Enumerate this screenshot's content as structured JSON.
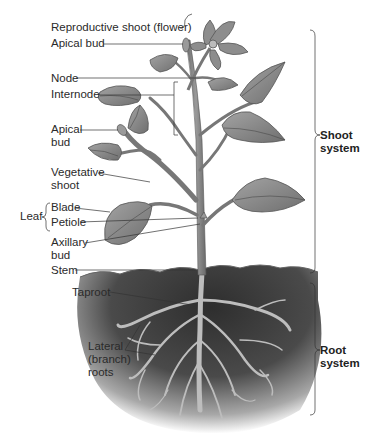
{
  "diagram": {
    "style": "grayscale",
    "colors": {
      "background": "#ffffff",
      "leaf_fill": "#8a8a8a",
      "leaf_vein": "#555555",
      "stem": "#7a7a7a",
      "soil_dark": "#3a3a3a",
      "root": "#b5b5b5",
      "label_text": "#2a2a2a",
      "leader_line": "#333333"
    }
  },
  "labels": {
    "reproductive_shoot": "Reproductive shoot (flower)",
    "apical_bud_top": "Apical bud",
    "node": "Node",
    "internode": "Internode",
    "apical_bud_side_1": "Apical",
    "apical_bud_side_2": "bud",
    "vegetative_1": "Vegetative",
    "vegetative_2": "shoot",
    "leaf": "Leaf",
    "blade": "Blade",
    "petiole": "Petiole",
    "axillary_1": "Axillary",
    "axillary_2": "bud",
    "stem": "Stem",
    "taproot": "Taproot",
    "lateral_1": "Lateral",
    "lateral_2": "(branch)",
    "lateral_3": "roots"
  },
  "systems": {
    "shoot_1": "Shoot",
    "shoot_2": "system",
    "root_1": "Root",
    "root_2": "system"
  }
}
